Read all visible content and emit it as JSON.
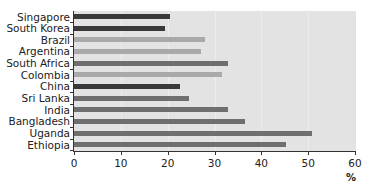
{
  "chart_data": {
    "type": "bar",
    "orientation": "horizontal",
    "title": "",
    "xlabel": "%",
    "ylabel": "",
    "xlim": [
      0,
      60
    ],
    "xticks": [
      0,
      10,
      20,
      30,
      40,
      50,
      60
    ],
    "grid": false,
    "legend": null,
    "categories": [
      "Singapore",
      "South Korea",
      "Brazil",
      "Argentina",
      "South Africa",
      "Colombia",
      "China",
      "Sri Lanka",
      "India",
      "Bangladesh",
      "Uganda",
      "Ethiopia"
    ],
    "values": [
      20.5,
      19.4,
      28.0,
      27.1,
      32.8,
      31.6,
      22.6,
      24.5,
      32.9,
      36.5,
      50.8,
      45.3
    ],
    "colors": [
      "#3a3a3a",
      "#3a3a3a",
      "#a9a9a9",
      "#a9a9a9",
      "#6f6f6f",
      "#a9a9a9",
      "#3a3a3a",
      "#6f6f6f",
      "#6f6f6f",
      "#6f6f6f",
      "#6f6f6f",
      "#6f6f6f"
    ]
  },
  "axis": {
    "unit": "%",
    "tick_labels": [
      "0",
      "10",
      "20",
      "30",
      "40",
      "50",
      "60"
    ]
  }
}
